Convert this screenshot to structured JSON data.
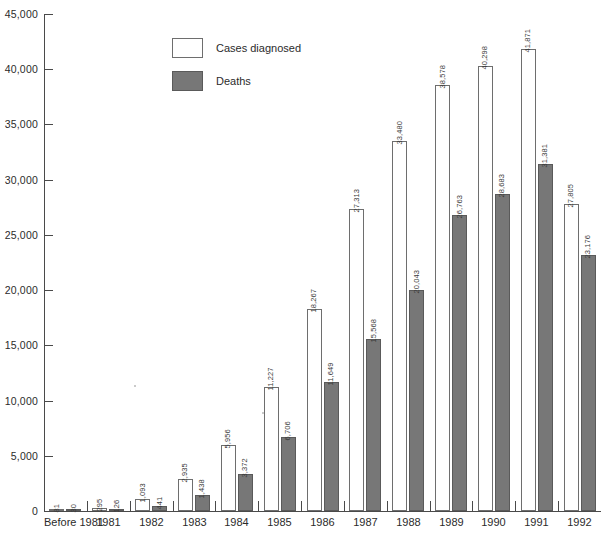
{
  "chart_data": {
    "type": "bar",
    "title": "",
    "xlabel": "",
    "ylabel": "",
    "ylim": [
      0,
      45000
    ],
    "grid": false,
    "legend_position": "top-center-left",
    "categories": [
      "Before 1981",
      "1981",
      "1982",
      "1983",
      "1984",
      "1985",
      "1986",
      "1987",
      "1988",
      "1989",
      "1990",
      "1991",
      "1992"
    ],
    "y_ticks": [
      0,
      5000,
      10000,
      15000,
      20000,
      25000,
      30000,
      35000,
      40000,
      45000
    ],
    "y_tick_labels": [
      "0",
      "5,000",
      "10,000",
      "15,000",
      "20,000",
      "25,000",
      "30,000",
      "35,000",
      "40,000",
      "45,000"
    ],
    "series": [
      {
        "name": "Cases diagnosed",
        "color": "#ffffff",
        "values": [
          81,
          295,
          1093,
          2935,
          5956,
          11227,
          18267,
          27313,
          33480,
          38578,
          40298,
          41871,
          27805
        ],
        "value_labels": [
          "81",
          "295",
          "1,093",
          "2,935",
          "5,956",
          "11,227",
          "18,267",
          "27,313",
          "33,480",
          "38,578",
          "40,298",
          "41,871",
          "27,805"
        ]
      },
      {
        "name": "Deaths",
        "color": "#777777",
        "values": [
          30,
          126,
          441,
          1438,
          3372,
          6706,
          11649,
          15568,
          20043,
          26763,
          28683,
          31381,
          23176
        ],
        "value_labels": [
          "30",
          "126",
          "441",
          "1,438",
          "3,372",
          "6,706",
          "11,649",
          "15,568",
          "20,043",
          "26,763",
          "28,683",
          "31,381",
          "23,176"
        ]
      }
    ]
  },
  "legend": {
    "items": [
      {
        "label": "Cases diagnosed",
        "swatch": "cases"
      },
      {
        "label": "Deaths",
        "swatch": "deaths"
      }
    ]
  }
}
